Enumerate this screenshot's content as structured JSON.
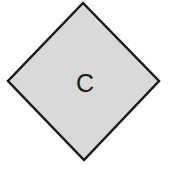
{
  "diagram": {
    "shape": "diamond",
    "label": "C",
    "fill_color": "#d9d9d9",
    "stroke_color": "#1a1a1a"
  }
}
